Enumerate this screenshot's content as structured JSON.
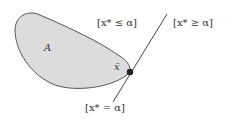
{
  "diagram": {
    "type": "convex-set-supporting-hyperplane",
    "colors": {
      "set_fill": "#dcdcdc",
      "set_stroke": "#555555",
      "line": "#444444",
      "point": "#222222",
      "text": "#333333"
    },
    "labels": {
      "set_name": "A",
      "point_name": "x̄",
      "halfspace_le": "[x* ≤ α]",
      "halfspace_ge": "[x* ≥ α]",
      "hyperplane": "[x* = α]"
    }
  }
}
